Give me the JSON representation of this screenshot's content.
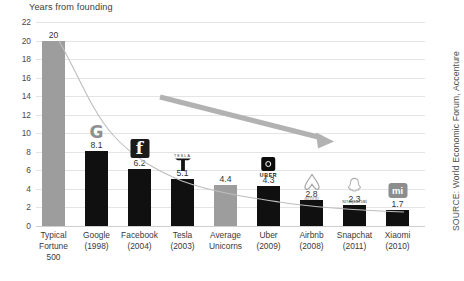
{
  "chart": {
    "axis_title": "Years from founding",
    "source_label": "SOURCE: World Economic Forum, Accenture"
  },
  "chart_data": {
    "type": "bar",
    "title": "",
    "subtitle": "",
    "xlabel": "",
    "ylabel": "Years from founding",
    "ylim": [
      0,
      22
    ],
    "ytick_step": 2,
    "grid": true,
    "legend": false,
    "categories": [
      "Typical Fortune 500",
      "Google (1998)",
      "Facebook (2004)",
      "Tesla (2003)",
      "Average Unicorns",
      "Uber (2009)",
      "Airbnb (2008)",
      "Snapchat (2011)",
      "Xiaomi (2010)"
    ],
    "values": [
      20,
      8.1,
      6.2,
      5.1,
      4.4,
      4.3,
      2.8,
      2.3,
      1.7
    ],
    "value_labels": [
      "20",
      "8.1",
      "6.2",
      "5.1",
      "4.4",
      "4.3",
      "2.8",
      "2.3",
      "1.7"
    ],
    "ytick_labels": [
      "22",
      "20",
      "18",
      "16",
      "14",
      "12",
      "10",
      "8",
      "6",
      "4",
      "2",
      "0"
    ],
    "colors": {
      "bar_default": "#101010",
      "bar_highlight": "#9d9d9d",
      "gridline": "#e4e4e4",
      "trendline": "#b5b5b5",
      "arrow": "#b0b0b0"
    },
    "annotations": [
      {
        "name": "declining-trend-arrow",
        "type": "arrow",
        "from_px": [
          160,
          97
        ],
        "to_px": [
          332,
          142
        ]
      },
      {
        "name": "trend-curve",
        "type": "line",
        "note": "smooth decay curve through bar tops"
      }
    ]
  },
  "bars": [
    {
      "name": "typical-fortune-500",
      "label_lines": [
        "Typical",
        "Fortune",
        "500"
      ],
      "value": 20,
      "value_label": "20",
      "highlight": true,
      "logo": "none"
    },
    {
      "name": "google",
      "label_lines": [
        "Google",
        "(1998)"
      ],
      "value": 8.1,
      "value_label": "8.1",
      "highlight": false,
      "logo": "google-logo",
      "logo_text": "G"
    },
    {
      "name": "facebook",
      "label_lines": [
        "Facebook",
        "(2004)"
      ],
      "value": 6.2,
      "value_label": "6.2",
      "highlight": false,
      "logo": "facebook-logo",
      "logo_text": "f"
    },
    {
      "name": "tesla",
      "label_lines": [
        "Tesla",
        "(2003)"
      ],
      "value": 5.1,
      "value_label": "5.1",
      "highlight": false,
      "logo": "tesla-logo",
      "logo_text": "TESLA"
    },
    {
      "name": "average-unicorns",
      "label_lines": [
        "Average",
        "Unicorns"
      ],
      "value": 4.4,
      "value_label": "4.4",
      "highlight": true,
      "logo": "none"
    },
    {
      "name": "uber",
      "label_lines": [
        "Uber",
        "(2009)"
      ],
      "value": 4.3,
      "value_label": "4.3",
      "highlight": false,
      "logo": "uber-logo",
      "logo_text": "UBER"
    },
    {
      "name": "airbnb",
      "label_lines": [
        "Airbnb",
        "(2008)"
      ],
      "value": 2.8,
      "value_label": "2.8",
      "highlight": false,
      "logo": "airbnb-logo",
      "logo_text": "airbnb"
    },
    {
      "name": "snapchat",
      "label_lines": [
        "Snapchat",
        "(2011)"
      ],
      "value": 2.3,
      "value_label": "2.3",
      "highlight": false,
      "logo": "snapchat-logo",
      "logo_text": "snapchat"
    },
    {
      "name": "xiaomi",
      "label_lines": [
        "Xiaomi",
        "(2010)"
      ],
      "value": 1.7,
      "value_label": "1.7",
      "highlight": false,
      "logo": "xiaomi-logo",
      "logo_text": "mi"
    }
  ]
}
